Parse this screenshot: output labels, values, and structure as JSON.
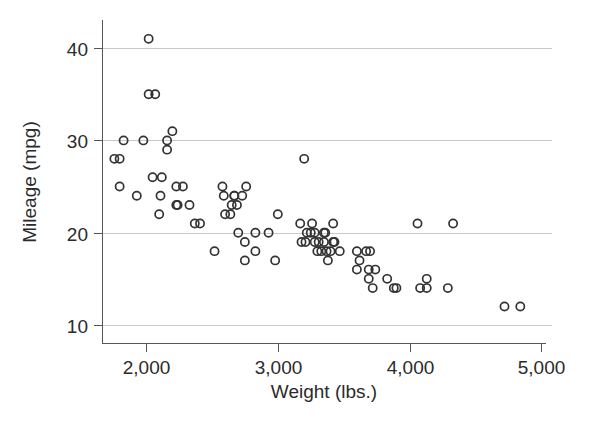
{
  "chart_data": {
    "type": "scatter",
    "title": "",
    "xlabel": "Weight (lbs.)",
    "ylabel": "Mileage (mpg)",
    "xlim": [
      1690,
      5000
    ],
    "ylim": [
      9.0,
      42.5
    ],
    "xticks": [
      2000,
      3000,
      4000,
      5000
    ],
    "xtick_labels": [
      "2,000",
      "3,000",
      "4,000",
      "5,000"
    ],
    "yticks": [
      10,
      20,
      30,
      40
    ],
    "ytick_labels": [
      "10",
      "20",
      "30",
      "40"
    ],
    "grid": "horizontal",
    "legend": "none",
    "marker": "open-circle",
    "marker_color": "#333333",
    "grid_color": "#c9c9c9",
    "axis_color": "#555555",
    "background_color": "#ffffff",
    "x": [
      1760,
      1800,
      1800,
      1830,
      1930,
      1980,
      2020,
      2020,
      2050,
      2070,
      2100,
      2110,
      2120,
      2160,
      2160,
      2200,
      2230,
      2230,
      2240,
      2280,
      2330,
      2370,
      2410,
      2520,
      2580,
      2590,
      2600,
      2640,
      2650,
      2670,
      2670,
      2690,
      2700,
      2730,
      2750,
      2750,
      2760,
      2830,
      2830,
      2930,
      2980,
      3000,
      3170,
      3180,
      3200,
      3210,
      3220,
      3250,
      3260,
      3280,
      3280,
      3300,
      3310,
      3330,
      3350,
      3350,
      3360,
      3370,
      3380,
      3400,
      3420,
      3420,
      3430,
      3470,
      3600,
      3600,
      3620,
      3670,
      3690,
      3690,
      3700,
      3720,
      3740,
      3830,
      3880,
      3900,
      4060,
      4080,
      4130,
      4130,
      4290,
      4330,
      4720,
      4840
    ],
    "y": [
      28,
      28,
      25,
      30,
      24,
      30,
      41,
      35,
      26,
      35,
      22,
      24,
      26,
      29,
      30,
      31,
      23,
      25,
      23,
      25,
      23,
      21,
      21,
      18,
      25,
      24,
      22,
      22,
      23,
      24,
      24,
      23,
      20,
      24,
      19,
      17,
      25,
      20,
      18,
      20,
      17,
      22,
      21,
      19,
      28,
      19,
      20,
      20,
      21,
      20,
      19,
      18,
      19,
      18,
      19,
      20,
      20,
      18,
      17,
      18,
      21,
      19,
      19,
      18,
      18,
      16,
      17,
      18,
      15,
      16,
      18,
      14,
      16,
      15,
      14,
      14,
      21,
      14,
      15,
      14,
      14,
      21,
      12,
      12
    ]
  },
  "axes": {
    "x_title": "Weight (lbs.)",
    "y_title": "Mileage (mpg)"
  }
}
